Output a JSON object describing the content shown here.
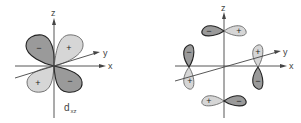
{
  "diagrams": [
    {
      "name": "d_xz orbital",
      "axes": {
        "z": "z",
        "x": "x",
        "y": "y"
      },
      "label": {
        "main": "d",
        "subscript": "xz"
      },
      "lobes": [
        {
          "position": "upper-left",
          "sign": "−",
          "shade": "dark"
        },
        {
          "position": "upper-right",
          "sign": "+",
          "shade": "light"
        },
        {
          "position": "lower-left",
          "sign": "+",
          "shade": "light"
        },
        {
          "position": "lower-right",
          "sign": "−",
          "shade": "dark"
        }
      ]
    },
    {
      "name": "p-orbital ring",
      "axes": {
        "z": "z",
        "x": "x",
        "y": "y"
      },
      "lobe_pairs": [
        {
          "position": "top",
          "signs": [
            "−",
            "+"
          ]
        },
        {
          "position": "right",
          "signs": [
            "+",
            "−"
          ]
        },
        {
          "position": "bottom",
          "signs": [
            "+",
            "−"
          ]
        },
        {
          "position": "left",
          "signs": [
            "−",
            "+"
          ]
        }
      ]
    }
  ],
  "colors": {
    "dark_lobe": "#9a9a9a",
    "light_lobe": "#d6d6d6",
    "axis": "#444444"
  }
}
